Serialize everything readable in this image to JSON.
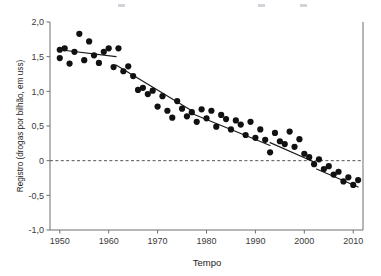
{
  "chart_data": {
    "type": "scatter",
    "title": "",
    "xlabel": "Tempo",
    "ylabel": "Registro (drogas por bilhão, em uss)",
    "xlim": [
      1948,
      2012
    ],
    "ylim": [
      -1.0,
      2.0
    ],
    "grid": false,
    "legend": null,
    "xticks": [
      1950,
      1960,
      1970,
      1980,
      1990,
      2000,
      2010
    ],
    "xtick_labels": [
      "1950",
      "1960",
      "1970",
      "1980",
      "1990",
      "2000",
      "2010"
    ],
    "yticks": [
      -1.0,
      -0.5,
      0,
      0.5,
      1.0,
      1.5,
      2.0
    ],
    "ytick_labels": [
      "-1,0",
      "-0,5",
      "0",
      "0,5",
      "1,0",
      "1,5",
      "2,0"
    ],
    "marker": {
      "shape": "circle",
      "color": "#111111",
      "size": 3.1
    },
    "reference_lines": [
      {
        "name": "zero-line",
        "orientation": "horizontal",
        "y": 0,
        "style": "dashed",
        "color": "#555555"
      }
    ],
    "series": [
      {
        "name": "Registro por ano",
        "points": [
          [
            1950,
            1.6
          ],
          [
            1950,
            1.48
          ],
          [
            1951,
            1.62
          ],
          [
            1952,
            1.4
          ],
          [
            1953,
            1.57
          ],
          [
            1954,
            1.83
          ],
          [
            1955,
            1.45
          ],
          [
            1956,
            1.72
          ],
          [
            1957,
            1.52
          ],
          [
            1958,
            1.41
          ],
          [
            1959,
            1.57
          ],
          [
            1960,
            1.62
          ],
          [
            1961,
            1.35
          ],
          [
            1962,
            1.62
          ],
          [
            1963,
            1.29
          ],
          [
            1964,
            1.36
          ],
          [
            1965,
            1.22
          ],
          [
            1966,
            1.02
          ],
          [
            1967,
            1.05
          ],
          [
            1968,
            0.96
          ],
          [
            1969,
            1.01
          ],
          [
            1970,
            0.78
          ],
          [
            1971,
            0.93
          ],
          [
            1972,
            0.72
          ],
          [
            1973,
            0.62
          ],
          [
            1974,
            0.86
          ],
          [
            1975,
            0.75
          ],
          [
            1976,
            0.64
          ],
          [
            1977,
            0.7
          ],
          [
            1978,
            0.56
          ],
          [
            1979,
            0.74
          ],
          [
            1980,
            0.61
          ],
          [
            1981,
            0.72
          ],
          [
            1982,
            0.49
          ],
          [
            1983,
            0.66
          ],
          [
            1984,
            0.6
          ],
          [
            1985,
            0.45
          ],
          [
            1986,
            0.58
          ],
          [
            1987,
            0.52
          ],
          [
            1988,
            0.37
          ],
          [
            1989,
            0.56
          ],
          [
            1990,
            0.33
          ],
          [
            1991,
            0.45
          ],
          [
            1992,
            0.3
          ],
          [
            1993,
            0.12
          ],
          [
            1994,
            0.4
          ],
          [
            1995,
            0.28
          ],
          [
            1996,
            0.24
          ],
          [
            1997,
            0.42
          ],
          [
            1998,
            0.2
          ],
          [
            1999,
            0.31
          ],
          [
            2000,
            0.1
          ],
          [
            2001,
            0.05
          ],
          [
            2002,
            -0.05
          ],
          [
            2003,
            0.02
          ],
          [
            2004,
            -0.12
          ],
          [
            2005,
            -0.08
          ],
          [
            2006,
            -0.2
          ],
          [
            2007,
            -0.16
          ],
          [
            2008,
            -0.3
          ],
          [
            2009,
            -0.24
          ],
          [
            2010,
            -0.35
          ],
          [
            2011,
            -0.28
          ]
        ]
      }
    ],
    "fit": {
      "name": "Regressão segmentada",
      "type": "piecewise-linear",
      "color": "#1b1b1b",
      "segments": [
        {
          "x0": 1950,
          "y0": 1.6,
          "x1": 1961.5,
          "y1": 1.5
        },
        {
          "x0": 1961.5,
          "y0": 1.38,
          "x1": 1977.0,
          "y1": 0.72
        },
        {
          "x0": 1977.0,
          "y0": 0.68,
          "x1": 1993.0,
          "y1": 0.22
        },
        {
          "x0": 1993.0,
          "y0": 0.26,
          "x1": 2002.0,
          "y1": -0.02
        },
        {
          "x0": 2002.5,
          "y0": -0.12,
          "x1": 2011.0,
          "y1": -0.38
        }
      ]
    }
  },
  "axes": {
    "x_title": "Tempo",
    "y_title": "Registro (drogas por bilhão, em uss)"
  }
}
